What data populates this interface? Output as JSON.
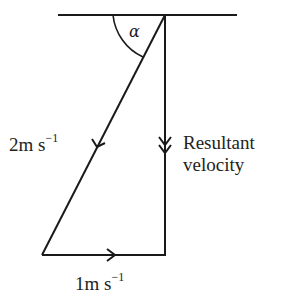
{
  "diagram": {
    "type": "vector-triangle",
    "angle_label": "α",
    "vectors": [
      {
        "id": "boat",
        "magnitude": "2",
        "unit": "m s",
        "exponent": "−1",
        "direction": "diagonal down-left",
        "arrowheads": 1
      },
      {
        "id": "current",
        "magnitude": "1",
        "unit": "m s",
        "exponent": "−1",
        "direction": "right",
        "arrowheads": 1
      },
      {
        "id": "resultant",
        "label_line1": "Resultant",
        "label_line2": "velocity",
        "direction": "down",
        "arrowheads": 2
      }
    ],
    "labels": {
      "boat_mag": "2",
      "boat_unit": "m s",
      "boat_exp": "−1",
      "current_mag": "1",
      "current_unit": "m s",
      "current_exp": "−1",
      "resultant_1": "Resultant",
      "resultant_2": "velocity",
      "alpha": "α"
    },
    "colors": {
      "line": "#1a1a1a",
      "text": "#222222",
      "background": "#ffffff"
    }
  }
}
